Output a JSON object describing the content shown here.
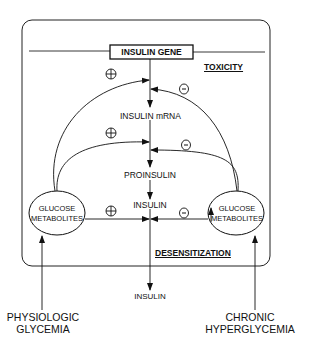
{
  "diagram": {
    "gene_box": "INSULIN GENE",
    "labels": {
      "toxicity": "TOXICITY",
      "desensitization": "DESENSITIZATION",
      "mrna": "INSULIN mRNA",
      "proinsulin": "PROINSULIN",
      "insulin_inner": "INSULIN",
      "insulin_output": "INSULIN"
    },
    "left_node": {
      "line1": "GLUCOSE",
      "line2": "METABOLITES"
    },
    "right_node": {
      "line1": "GLUCOSE",
      "line2": "METABOLITES"
    },
    "inputs": {
      "left": {
        "line1": "PHYSIOLOGIC",
        "line2": "GLYCEMIA"
      },
      "right": {
        "line1": "CHRONIC",
        "line2": "HYPERGLYCEMIA"
      }
    },
    "signs": {
      "plus": "+",
      "minus": "-"
    },
    "edges": [
      {
        "from": "left_node",
        "to": "gene_to_mrna",
        "effect": "+"
      },
      {
        "from": "right_node",
        "to": "gene_to_mrna",
        "effect": "-"
      },
      {
        "from": "left_node",
        "to": "mrna_to_proinsulin",
        "effect": "+"
      },
      {
        "from": "right_node",
        "to": "mrna_to_proinsulin",
        "effect": "-"
      },
      {
        "from": "left_node",
        "to": "insulin",
        "effect": "+"
      },
      {
        "from": "right_node",
        "to": "insulin",
        "effect": "-"
      }
    ],
    "colors": {
      "ink": "#111111",
      "background": "#ffffff"
    }
  }
}
